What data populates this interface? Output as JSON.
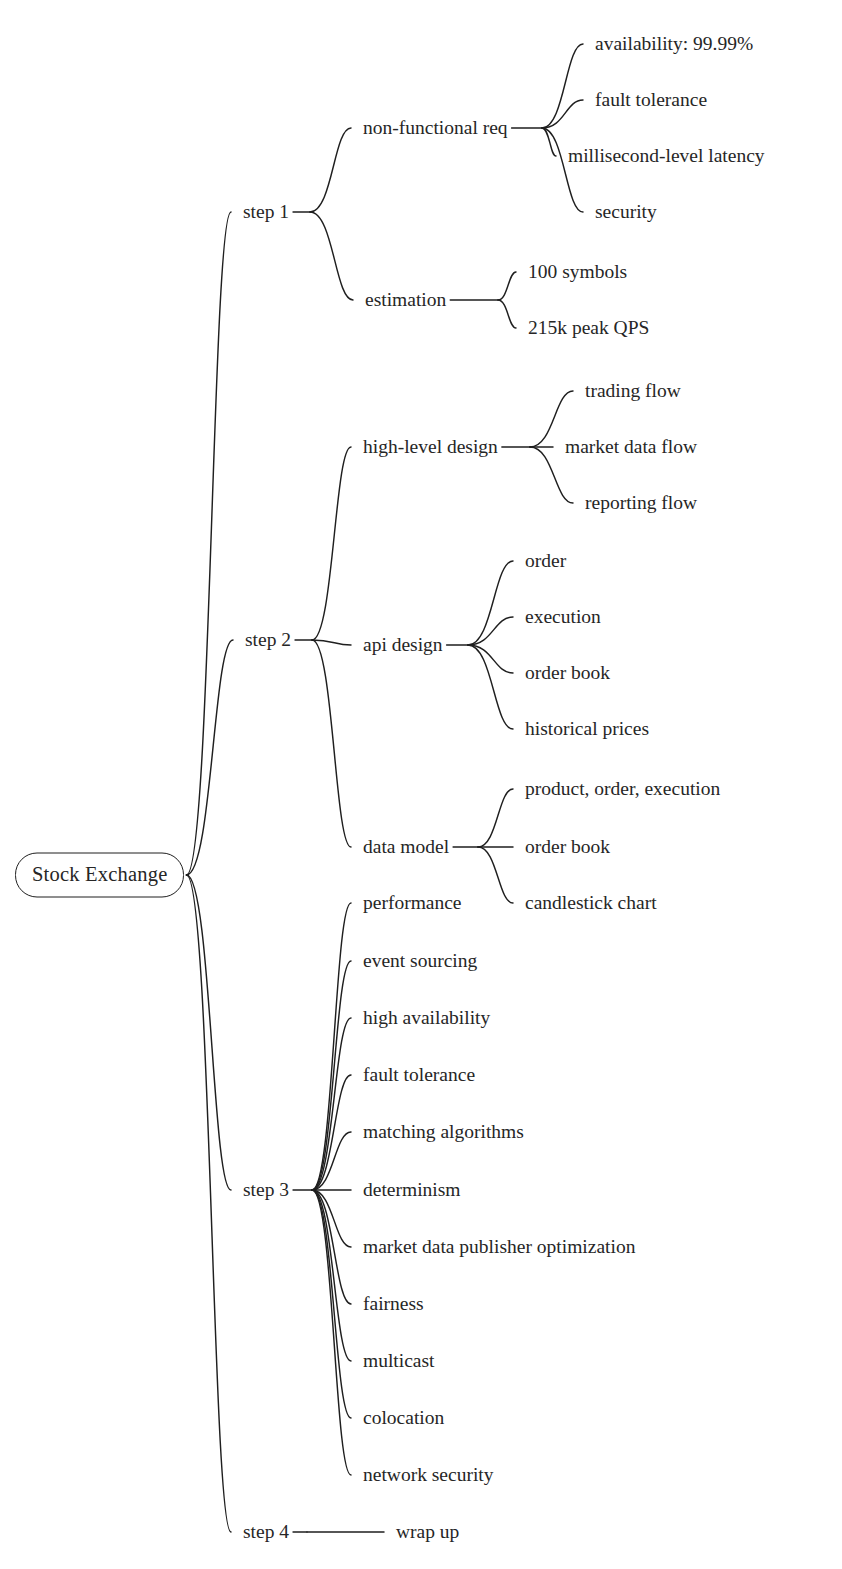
{
  "diagram": {
    "type": "mind-map",
    "title": "Stock Exchange",
    "orientation": "left-to-right",
    "background_color": "#ffffff",
    "text_color": "#262626",
    "edge_color": "#1f1f1f"
  },
  "root": {
    "label": "Stock Exchange",
    "x": 15,
    "y": 875
  },
  "branches": [
    {
      "label": "step 1",
      "x": 243,
      "y": 212,
      "fan_x": 310,
      "children": [
        {
          "label": "non-functional req",
          "x": 363,
          "y": 128,
          "fan_x": 542,
          "children": [
            {
              "label": "availability: 99.99%",
              "x": 595,
              "y": 44
            },
            {
              "label": "fault tolerance",
              "x": 595,
              "y": 100
            },
            {
              "label": "millisecond-level latency",
              "x": 568,
              "y": 156
            },
            {
              "label": "security",
              "x": 595,
              "y": 212
            }
          ]
        },
        {
          "label": "estimation",
          "x": 365,
          "y": 300,
          "fan_x": 498,
          "children": [
            {
              "label": "100 symbols",
              "x": 528,
              "y": 272
            },
            {
              "label": "215k peak QPS",
              "x": 528,
              "y": 328
            }
          ]
        }
      ]
    },
    {
      "label": "step 2",
      "x": 245,
      "y": 640,
      "fan_x": 312,
      "children": [
        {
          "label": "high-level design",
          "x": 363,
          "y": 447,
          "fan_x": 530,
          "children": [
            {
              "label": "trading flow",
              "x": 585,
              "y": 391
            },
            {
              "label": "market data flow",
              "x": 565,
              "y": 447
            },
            {
              "label": "reporting flow",
              "x": 585,
              "y": 503
            }
          ]
        },
        {
          "label": "api design",
          "x": 363,
          "y": 645,
          "fan_x": 468,
          "children": [
            {
              "label": "order",
              "x": 525,
              "y": 561
            },
            {
              "label": "execution",
              "x": 525,
              "y": 617
            },
            {
              "label": "order book",
              "x": 525,
              "y": 673
            },
            {
              "label": "historical prices",
              "x": 525,
              "y": 729
            }
          ]
        },
        {
          "label": "data model",
          "x": 363,
          "y": 847,
          "fan_x": 478,
          "children": [
            {
              "label": "product, order, execution",
              "x": 525,
              "y": 789
            },
            {
              "label": "order book",
              "x": 525,
              "y": 847
            },
            {
              "label": "candlestick chart",
              "x": 525,
              "y": 903
            }
          ]
        }
      ]
    },
    {
      "label": "step 3",
      "x": 243,
      "y": 1190,
      "fan_x": 312,
      "children": [
        {
          "label": "performance",
          "x": 363,
          "y": 903
        },
        {
          "label": "event sourcing",
          "x": 363,
          "y": 961
        },
        {
          "label": "high availability",
          "x": 363,
          "y": 1018
        },
        {
          "label": "fault tolerance",
          "x": 363,
          "y": 1075
        },
        {
          "label": "matching algorithms",
          "x": 363,
          "y": 1132
        },
        {
          "label": "determinism",
          "x": 363,
          "y": 1190
        },
        {
          "label": "market data publisher optimization",
          "x": 363,
          "y": 1247
        },
        {
          "label": "fairness",
          "x": 363,
          "y": 1304
        },
        {
          "label": "multicast",
          "x": 363,
          "y": 1361
        },
        {
          "label": "colocation",
          "x": 363,
          "y": 1418
        },
        {
          "label": "network security",
          "x": 363,
          "y": 1475
        }
      ]
    },
    {
      "label": "step 4",
      "x": 243,
      "y": 1532,
      "fan_x": 307,
      "children": [
        {
          "label": "wrap up",
          "x": 396,
          "y": 1532
        }
      ]
    }
  ]
}
